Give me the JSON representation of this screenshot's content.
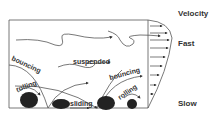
{
  "diagram": {
    "labels": {
      "suspended": "suspended",
      "bouncing_left": "bouncing",
      "bouncing_right": "bouncing",
      "rolling_left": "rolling",
      "rolling_right": "rolling",
      "sliding": "sliding"
    },
    "velocity_profile": {
      "title": "Velocity",
      "top": "Fast",
      "bottom": "Slow"
    }
  }
}
